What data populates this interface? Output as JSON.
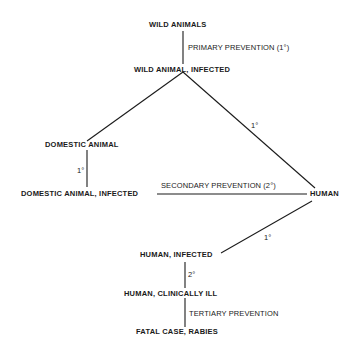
{
  "diagram": {
    "nodes": {
      "wild_animals": "WILD ANIMALS",
      "wild_animal_infected": "WILD ANIMAL, INFECTED",
      "domestic_animal": "DOMESTIC ANIMAL",
      "domestic_animal_infected": "DOMESTIC ANIMAL, INFECTED",
      "human": "HUMAN",
      "human_infected": "HUMAN, INFECTED",
      "human_clinically_ill": "HUMAN, CLINICALLY ILL",
      "fatal_case": "FATAL CASE, RABIES"
    },
    "edge_labels": {
      "primary_prevention": "PRIMARY PREVENTION (1°)",
      "wild_to_domestic": "",
      "domestic_to_infected": "1°",
      "wild_to_human": "1°",
      "secondary_prevention": "SECONDARY PREVENTION (2°)",
      "human_to_infected": "1°",
      "infected_to_ill": "2°",
      "tertiary_prevention": "TERTIARY PREVENTION"
    },
    "colors": {
      "line": "#1a1a1a",
      "text": "#1a1a1a",
      "background": "#ffffff"
    }
  }
}
